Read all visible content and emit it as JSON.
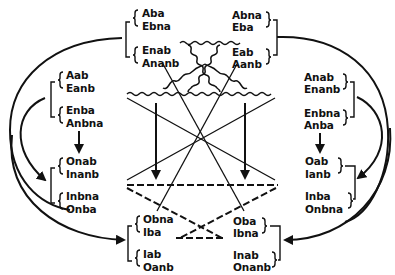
{
  "diagram": {
    "groups": {
      "top_left": {
        "pairs": [
          [
            "Aba",
            "Ebna"
          ],
          [
            "Enab",
            "Ananb"
          ]
        ]
      },
      "top_right": {
        "pairs": [
          [
            "Abna",
            "Eba"
          ],
          [
            "Eab",
            "Aanb"
          ]
        ]
      },
      "mid_left": {
        "pairs": [
          [
            "Aab",
            "Eanb"
          ],
          [
            "Enba",
            "Anbna"
          ]
        ]
      },
      "mid_right": {
        "pairs": [
          [
            "Anab",
            "Enanb"
          ],
          [
            "Enbna",
            "Anba"
          ]
        ]
      },
      "lower_left": {
        "pairs": [
          [
            "Onab",
            "Inanb"
          ],
          [
            "Inbna",
            "Onba"
          ]
        ]
      },
      "lower_right": {
        "pairs": [
          [
            "Oab",
            "Ianb"
          ],
          [
            "Inba",
            "Onbna"
          ]
        ]
      },
      "bottom_left": {
        "pairs": [
          [
            "Obna",
            "Iba"
          ],
          [
            "Iab",
            "Oanb"
          ]
        ]
      },
      "bottom_right": {
        "pairs": [
          [
            "Oba",
            "Ibna"
          ],
          [
            "Inab",
            "Onanb"
          ]
        ]
      }
    },
    "line_styles": {
      "wavy": "contrary relation",
      "solid": "contradictory relation",
      "dashed": "subcontrary relation",
      "arrow": "implication"
    },
    "colors": {
      "ink": "#111111",
      "background": "#ffffff"
    }
  }
}
